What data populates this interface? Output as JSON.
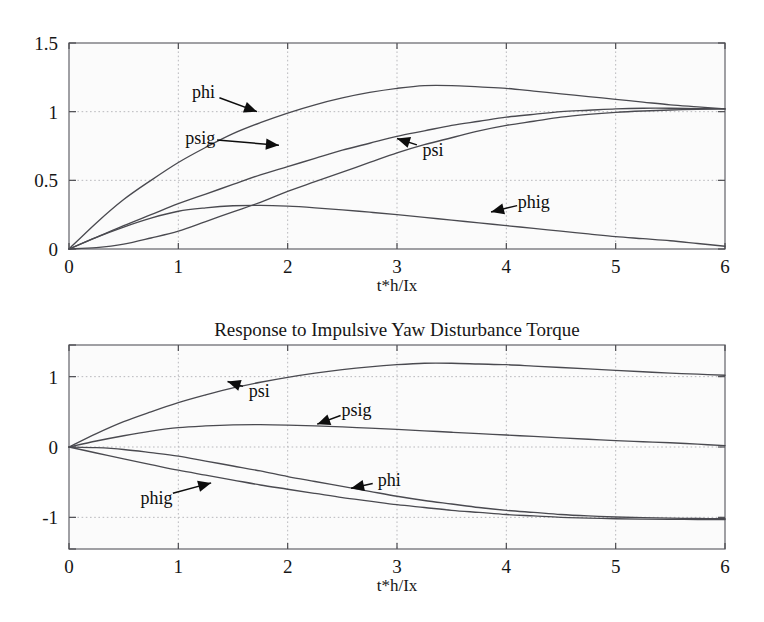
{
  "figure": {
    "background_color": "#ffffff",
    "axes_background_color": "#fbfbfb",
    "curve_color": "#4a4a50",
    "grid_color": "#b9b9bd",
    "frame_color": "#6e6e74",
    "annotation_color": "#0d0d0d"
  },
  "chart_data": [
    {
      "id": "upper",
      "type": "line",
      "title": "",
      "xlabel": "t*h/Ix",
      "ylabel": "",
      "xlim": [
        0,
        6
      ],
      "ylim": [
        0,
        1.5
      ],
      "xticks": [
        "0",
        "1",
        "2",
        "3",
        "4",
        "5",
        "6"
      ],
      "xtick_values": [
        0,
        1,
        2,
        3,
        4,
        5,
        6
      ],
      "yticks": [
        "0",
        "0.5",
        "1",
        "1.5"
      ],
      "ytick_values": [
        0,
        0.5,
        1,
        1.5
      ],
      "grid": true,
      "grid_style": "dotted",
      "legend": "inline-annotations",
      "x": [
        0,
        0.25,
        0.5,
        0.75,
        1,
        1.25,
        1.5,
        1.75,
        2,
        2.25,
        2.5,
        2.75,
        3,
        3.25,
        3.5,
        3.75,
        4,
        4.25,
        4.5,
        4.75,
        5,
        5.25,
        5.5,
        5.75,
        6
      ],
      "series": [
        {
          "name": "phi",
          "values": [
            0,
            0.19,
            0.36,
            0.5,
            0.63,
            0.74,
            0.84,
            0.92,
            0.99,
            1.05,
            1.1,
            1.14,
            1.17,
            1.19,
            1.19,
            1.18,
            1.17,
            1.15,
            1.13,
            1.11,
            1.09,
            1.07,
            1.05,
            1.035,
            1.02
          ],
          "annotation": {
            "label": "phi",
            "label_x": 1.23,
            "label_y": 1.145,
            "arrow_to_x": 1.72,
            "arrow_to_y": 1.0
          }
        },
        {
          "name": "psig",
          "values": [
            0,
            0.085,
            0.17,
            0.25,
            0.33,
            0.4,
            0.47,
            0.54,
            0.6,
            0.66,
            0.72,
            0.77,
            0.82,
            0.86,
            0.9,
            0.93,
            0.96,
            0.98,
            1.0,
            1.01,
            1.02,
            1.025,
            1.025,
            1.022,
            1.02
          ],
          "annotation": {
            "label": "psig",
            "label_x": 1.2,
            "label_y": 0.805,
            "arrow_to_x": 1.92,
            "arrow_to_y": 0.755
          }
        },
        {
          "name": "psi",
          "values": [
            0,
            0.01,
            0.035,
            0.08,
            0.13,
            0.2,
            0.27,
            0.34,
            0.42,
            0.49,
            0.56,
            0.63,
            0.7,
            0.76,
            0.81,
            0.86,
            0.9,
            0.93,
            0.96,
            0.98,
            0.995,
            1.005,
            1.012,
            1.017,
            1.02
          ],
          "annotation": {
            "label": "psi",
            "label_x": 3.33,
            "label_y": 0.72,
            "arrow_to_x": 3.0,
            "arrow_to_y": 0.805
          }
        },
        {
          "name": "phig",
          "values": [
            0,
            0.085,
            0.16,
            0.225,
            0.275,
            0.3,
            0.315,
            0.318,
            0.312,
            0.3,
            0.285,
            0.268,
            0.25,
            0.23,
            0.21,
            0.19,
            0.17,
            0.15,
            0.13,
            0.11,
            0.09,
            0.075,
            0.06,
            0.04,
            0.02
          ],
          "annotation": {
            "label": "phig",
            "label_x": 4.25,
            "label_y": 0.345,
            "arrow_to_x": 3.86,
            "arrow_to_y": 0.27
          }
        }
      ]
    },
    {
      "id": "lower",
      "type": "line",
      "title": "Response to Impulsive Yaw Disturbance Torque",
      "xlabel": "t*h/Ix",
      "ylabel": "",
      "xlim": [
        0,
        6
      ],
      "ylim": [
        -1.45,
        1.45
      ],
      "xticks": [
        "0",
        "1",
        "2",
        "3",
        "4",
        "5",
        "6"
      ],
      "xtick_values": [
        0,
        1,
        2,
        3,
        4,
        5,
        6
      ],
      "yticks": [
        "-1",
        "0",
        "1"
      ],
      "ytick_values": [
        -1,
        0,
        1
      ],
      "grid": true,
      "grid_style": "dotted",
      "legend": "inline-annotations",
      "x": [
        0,
        0.25,
        0.5,
        0.75,
        1,
        1.25,
        1.5,
        1.75,
        2,
        2.25,
        2.5,
        2.75,
        3,
        3.25,
        3.5,
        3.75,
        4,
        4.25,
        4.5,
        4.75,
        5,
        5.25,
        5.5,
        5.75,
        6
      ],
      "series": [
        {
          "name": "psi",
          "values": [
            0,
            0.19,
            0.36,
            0.5,
            0.63,
            0.74,
            0.84,
            0.92,
            0.99,
            1.05,
            1.1,
            1.14,
            1.17,
            1.19,
            1.19,
            1.18,
            1.17,
            1.15,
            1.13,
            1.11,
            1.09,
            1.07,
            1.05,
            1.035,
            1.02
          ],
          "annotation": {
            "label": "psi",
            "label_x": 1.74,
            "label_y": 0.79,
            "arrow_to_x": 1.45,
            "arrow_to_y": 0.93
          }
        },
        {
          "name": "psig",
          "values": [
            0,
            0.085,
            0.16,
            0.225,
            0.275,
            0.3,
            0.315,
            0.318,
            0.312,
            0.3,
            0.285,
            0.268,
            0.25,
            0.23,
            0.21,
            0.19,
            0.17,
            0.15,
            0.13,
            0.11,
            0.09,
            0.075,
            0.06,
            0.04,
            0.02
          ],
          "annotation": {
            "label": "psig",
            "label_x": 2.63,
            "label_y": 0.53,
            "arrow_to_x": 2.27,
            "arrow_to_y": 0.325
          }
        },
        {
          "name": "phi",
          "values": [
            0,
            -0.01,
            -0.035,
            -0.08,
            -0.13,
            -0.2,
            -0.27,
            -0.34,
            -0.42,
            -0.49,
            -0.56,
            -0.63,
            -0.7,
            -0.76,
            -0.81,
            -0.86,
            -0.9,
            -0.93,
            -0.96,
            -0.98,
            -0.995,
            -1.005,
            -1.012,
            -1.017,
            -1.02
          ],
          "annotation": {
            "label": "phi",
            "label_x": 2.93,
            "label_y": -0.47,
            "arrow_to_x": 2.58,
            "arrow_to_y": -0.585
          }
        },
        {
          "name": "phig",
          "values": [
            0,
            -0.085,
            -0.17,
            -0.25,
            -0.33,
            -0.4,
            -0.47,
            -0.54,
            -0.6,
            -0.66,
            -0.72,
            -0.77,
            -0.82,
            -0.86,
            -0.9,
            -0.93,
            -0.96,
            -0.98,
            -1.0,
            -1.01,
            -1.02,
            -1.025,
            -1.028,
            -1.03,
            -1.03
          ],
          "annotation": {
            "label": "phig",
            "label_x": 0.8,
            "label_y": -0.72,
            "arrow_to_x": 1.3,
            "arrow_to_y": -0.51
          }
        }
      ]
    }
  ]
}
